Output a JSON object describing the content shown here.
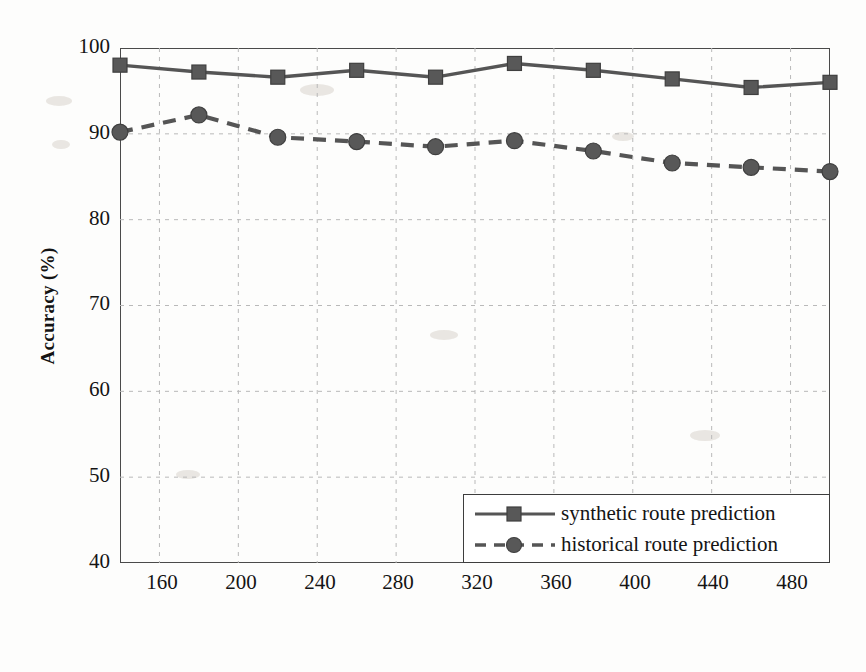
{
  "chart_data": {
    "type": "line",
    "title": "",
    "xlabel": "Density",
    "ylabel": "Accuracy (%)",
    "xlim": [
      140,
      500
    ],
    "ylim": [
      40,
      100
    ],
    "xticks": [
      160,
      200,
      240,
      280,
      320,
      360,
      400,
      440,
      480
    ],
    "yticks": [
      40,
      50,
      60,
      70,
      80,
      90,
      100
    ],
    "grid": true,
    "legend_position": "lower right",
    "x": [
      140,
      180,
      220,
      260,
      300,
      340,
      380,
      420,
      460,
      500
    ],
    "series": [
      {
        "name": "synthetic route prediction",
        "values": [
          98.0,
          97.2,
          96.6,
          97.4,
          96.6,
          98.2,
          97.4,
          96.4,
          95.4,
          96.0
        ],
        "marker": "square",
        "linestyle": "solid",
        "color": "#555555"
      },
      {
        "name": "historical route prediction",
        "values": [
          90.2,
          92.2,
          89.6,
          89.1,
          88.5,
          89.2,
          88.0,
          86.6,
          86.1,
          85.6
        ],
        "marker": "circle",
        "linestyle": "dashed",
        "color": "#555555"
      }
    ]
  },
  "axes": {
    "y_title": "Accuracy (%)",
    "x_title": "Density",
    "y_tick_labels": [
      "100",
      "90",
      "80",
      "70",
      "60",
      "50",
      "40"
    ],
    "x_tick_labels": [
      "160",
      "200",
      "240",
      "280",
      "320",
      "360",
      "400",
      "440",
      "480"
    ]
  },
  "legend": {
    "items": [
      {
        "label": "synthetic route prediction"
      },
      {
        "label": "historical route prediction"
      }
    ]
  },
  "colors": {
    "line": "#555555",
    "frame": "#4a4a4a",
    "grid": "#b9b9b9",
    "text": "#141414"
  }
}
